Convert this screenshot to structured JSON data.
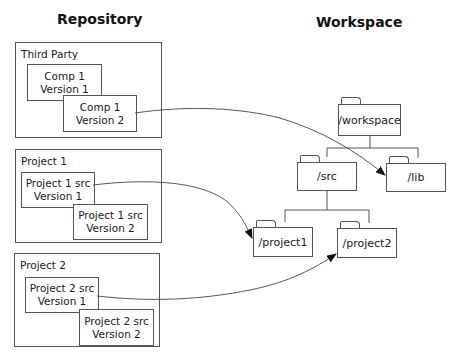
{
  "titles": {
    "repository": "Repository",
    "workspace": "Workspace"
  },
  "repository": {
    "groups": [
      {
        "label": "Third Party",
        "items": [
          {
            "line1": "Comp 1",
            "line2": "Version 1"
          },
          {
            "line1": "Comp 1",
            "line2": "Version 2"
          }
        ]
      },
      {
        "label": "Project 1",
        "items": [
          {
            "line1": "Project 1 src",
            "line2": "Version 1"
          },
          {
            "line1": "Project 1 src",
            "line2": "Version 2"
          }
        ]
      },
      {
        "label": "Project 2",
        "items": [
          {
            "line1": "Project 2 src",
            "line2": "Version 1"
          },
          {
            "line1": "Project 2 src",
            "line2": "Version 2"
          }
        ]
      }
    ]
  },
  "workspace": {
    "folders": {
      "root": "/workspace",
      "src": "/src",
      "lib": "/lib",
      "project1": "/project1",
      "project2": "/project2"
    }
  },
  "mappings": [
    {
      "from": "Comp 1 Version 2",
      "to": "/lib"
    },
    {
      "from": "Project 1 src Version 1",
      "to": "/project1"
    },
    {
      "from": "Project 2 src Version 1",
      "to": "/project2"
    }
  ],
  "colors": {
    "line": "#555555",
    "text": "#1a1a1a",
    "background": "#ffffff"
  }
}
